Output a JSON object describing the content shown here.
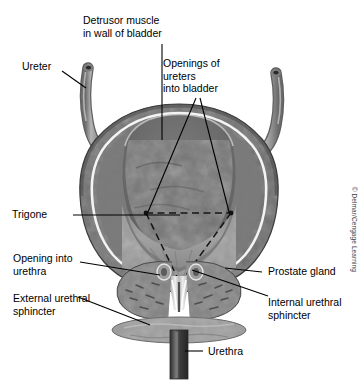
{
  "figure": {
    "credit": "© Delmar/Cengage Learning",
    "labels": {
      "detrusor": "Detrusor muscle\nin wall of bladder",
      "ureter": "Ureter",
      "openings": "Openings of\nureters\ninto bladder",
      "trigone": "Trigone",
      "opening_urethra": "Opening into\nurethra",
      "external_sphincter": "External urethral\nsphincter",
      "prostate": "Prostate gland",
      "internal_sphincter": "Internal urethral\nsphincter",
      "urethra": "Urethra"
    },
    "colors": {
      "background": "#ffffff",
      "leader_line": "#000000",
      "text": "#000000",
      "wall_outer": "#5a5a5a",
      "wall_mid": "#6f6f6f",
      "mucosa_line": "#f2f2f2",
      "cavity_dark": "#6a6a6a",
      "cavity_light": "#9b9b9b",
      "ureter_tube": "#8d8d8d",
      "prostate": "#838383",
      "sphincter_disc": "#9d9d9d",
      "urethra_tube": "#4a4a4a",
      "trigone_dash": "#1a1a1a"
    }
  }
}
